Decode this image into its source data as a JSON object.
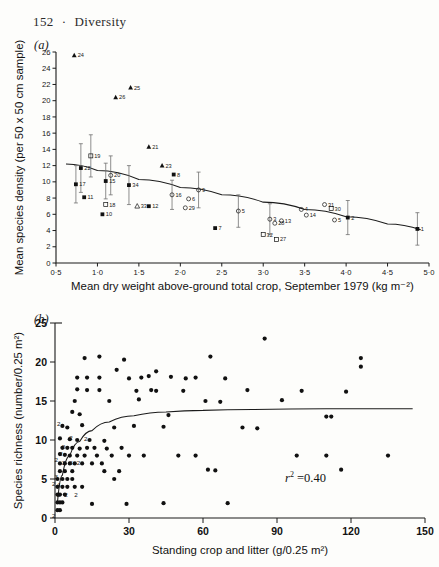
{
  "page": {
    "number": "152",
    "separator": "·",
    "running_head": "Diversity"
  },
  "panels": {
    "a_label": "(a)",
    "b_label": "(b)"
  },
  "chart_data": [
    {
      "type": "scatter",
      "panel": "(a)",
      "title": "",
      "xlabel": "Mean dry weight above-ground total crop, September 1979 (kg m⁻²)",
      "ylabel": "Mean species density (per 50 x 50 cm sample)",
      "xlim": [
        0.5,
        5.0
      ],
      "ylim": [
        0,
        26
      ],
      "xticks": [
        "0·5",
        "1·0",
        "1·5",
        "2·0",
        "2·5",
        "3·0",
        "3·5",
        "4·0",
        "4·5",
        "5·0"
      ],
      "xtick_values": [
        0.5,
        1.0,
        1.5,
        2.0,
        2.5,
        3.0,
        3.5,
        4.0,
        4.5,
        5.0
      ],
      "yticks": [
        "0",
        "2",
        "4",
        "6",
        "8",
        "10",
        "12",
        "14",
        "16",
        "18",
        "20",
        "22",
        "24",
        "26"
      ],
      "ytick_values": [
        0,
        2,
        4,
        6,
        8,
        10,
        12,
        14,
        16,
        18,
        20,
        22,
        24,
        26
      ],
      "grid": false,
      "legend": "none",
      "fit_curve": {
        "description": "declining fitted curve",
        "points": [
          [
            0.62,
            12.2
          ],
          [
            1.0,
            11.4
          ],
          [
            1.5,
            10.3
          ],
          [
            2.0,
            9.3
          ],
          [
            2.5,
            8.4
          ],
          [
            3.0,
            7.5
          ],
          [
            3.5,
            6.6
          ],
          [
            4.0,
            5.7
          ],
          [
            4.5,
            4.8
          ],
          [
            4.9,
            4.1
          ]
        ]
      },
      "points": [
        {
          "label": "24",
          "x": 0.72,
          "y": 25.6,
          "marker": "filled-triangle",
          "err": 0
        },
        {
          "label": "25",
          "x": 1.4,
          "y": 21.6,
          "marker": "filled-triangle",
          "err": 0
        },
        {
          "label": "26",
          "x": 1.22,
          "y": 20.4,
          "marker": "filled-triangle",
          "err": 0
        },
        {
          "label": "21",
          "x": 1.62,
          "y": 14.3,
          "marker": "filled-triangle",
          "err": 0
        },
        {
          "label": "19",
          "x": 0.92,
          "y": 13.2,
          "marker": "open-square",
          "err": 2.6
        },
        {
          "label": "22",
          "x": 0.8,
          "y": 11.7,
          "marker": "filled-square",
          "err": 3.0
        },
        {
          "label": "23",
          "x": 1.78,
          "y": 12.0,
          "marker": "filled-triangle",
          "err": 0
        },
        {
          "label": "8",
          "x": 1.92,
          "y": 10.9,
          "marker": "filled-square",
          "err": 0
        },
        {
          "label": "20",
          "x": 1.16,
          "y": 10.8,
          "marker": "open-circle",
          "err": 2.4
        },
        {
          "label": "15",
          "x": 1.1,
          "y": 10.1,
          "marker": "filled-square",
          "err": 2.2
        },
        {
          "label": "17",
          "x": 0.74,
          "y": 9.7,
          "marker": "filled-square",
          "err": 2.3
        },
        {
          "label": "34",
          "x": 1.38,
          "y": 9.6,
          "marker": "filled-square",
          "err": 2.4
        },
        {
          "label": "11",
          "x": 0.84,
          "y": 8.1,
          "marker": "filled-square",
          "err": 0
        },
        {
          "label": "18",
          "x": 1.1,
          "y": 7.2,
          "marker": "open-square",
          "err": 0
        },
        {
          "label": "16",
          "x": 1.9,
          "y": 8.4,
          "marker": "open-circle",
          "err": 1.8
        },
        {
          "label": "33",
          "x": 1.48,
          "y": 7.0,
          "marker": "open-triangle",
          "err": 0
        },
        {
          "label": "12",
          "x": 1.62,
          "y": 7.0,
          "marker": "filled-square",
          "err": 0
        },
        {
          "label": "10",
          "x": 1.06,
          "y": 6.0,
          "marker": "filled-square",
          "err": 0
        },
        {
          "label": "9",
          "x": 2.22,
          "y": 9.0,
          "marker": "open-circle",
          "err": 2.2
        },
        {
          "label": "6",
          "x": 2.1,
          "y": 7.9,
          "marker": "open-circle",
          "err": 0
        },
        {
          "label": "29",
          "x": 2.06,
          "y": 6.8,
          "marker": "open-circle",
          "err": 0
        },
        {
          "label": "7",
          "x": 2.42,
          "y": 4.3,
          "marker": "filled-square",
          "err": 0
        },
        {
          "label": "5",
          "x": 2.7,
          "y": 6.4,
          "marker": "open-circle",
          "err": 2.0
        },
        {
          "label": "3",
          "x": 3.08,
          "y": 5.4,
          "marker": "open-circle",
          "err": 1.9
        },
        {
          "label": "13",
          "x": 3.22,
          "y": 5.2,
          "marker": "open-circle",
          "err": 0
        },
        {
          "label": "28",
          "x": 3.14,
          "y": 4.9,
          "marker": "open-circle",
          "err": 0
        },
        {
          "label": "32",
          "x": 3.0,
          "y": 3.5,
          "marker": "open-square",
          "err": 0
        },
        {
          "label": "27",
          "x": 3.16,
          "y": 2.9,
          "marker": "open-square",
          "err": 0
        },
        {
          "label": "4",
          "x": 3.46,
          "y": 6.6,
          "marker": "open-circle",
          "err": 0
        },
        {
          "label": "31",
          "x": 3.74,
          "y": 7.2,
          "marker": "open-circle",
          "err": 0
        },
        {
          "label": "30",
          "x": 3.82,
          "y": 6.7,
          "marker": "open-square",
          "err": 0
        },
        {
          "label": "14",
          "x": 3.52,
          "y": 5.9,
          "marker": "open-circle",
          "err": 0
        },
        {
          "label": "5",
          "x": 3.86,
          "y": 5.3,
          "marker": "open-circle",
          "err": 0
        },
        {
          "label": "2",
          "x": 4.02,
          "y": 5.6,
          "marker": "filled-square",
          "err": 2.1
        },
        {
          "label": "1",
          "x": 4.86,
          "y": 4.2,
          "marker": "filled-square",
          "err": 2.0
        }
      ]
    },
    {
      "type": "scatter",
      "panel": "(b)",
      "title": "",
      "xlabel": "Standing crop and litter (g/0.25 m²)",
      "ylabel": "Species richness (number/0.25 m²)",
      "xlim": [
        0,
        150
      ],
      "ylim": [
        0,
        25
      ],
      "xticks": [
        "0",
        "30",
        "60",
        "90",
        "120",
        "150"
      ],
      "xtick_values": [
        0,
        30,
        60,
        90,
        120,
        150
      ],
      "yticks": [
        "0",
        "5",
        "10",
        "15",
        "20",
        "25"
      ],
      "ytick_values": [
        0,
        5,
        10,
        15,
        20,
        25
      ],
      "grid": false,
      "legend": "none",
      "annotation": {
        "text": "r² = 0.40",
        "symbol": "r",
        "exponent": "2",
        "value": "0.40"
      },
      "fit_curve": {
        "description": "asymptotic rising curve levelling near 14",
        "points": [
          [
            1,
            2.0
          ],
          [
            3,
            5.5
          ],
          [
            6,
            8.0
          ],
          [
            10,
            9.8
          ],
          [
            15,
            11.2
          ],
          [
            22,
            12.3
          ],
          [
            32,
            13.1
          ],
          [
            45,
            13.6
          ],
          [
            60,
            13.8
          ],
          [
            80,
            13.9
          ],
          [
            110,
            14.0
          ],
          [
            145,
            14.0
          ]
        ]
      },
      "points": [
        [
          85,
          23.0
        ],
        [
          12,
          20.5
        ],
        [
          18,
          20.7
        ],
        [
          28,
          20.3
        ],
        [
          63,
          20.7
        ],
        [
          124,
          20.5
        ],
        [
          124,
          19.4
        ],
        [
          25,
          19.0
        ],
        [
          41,
          18.8
        ],
        [
          9,
          18.0
        ],
        [
          13,
          18.0
        ],
        [
          18,
          18.0
        ],
        [
          30,
          17.9
        ],
        [
          35,
          18.0
        ],
        [
          38,
          18.2
        ],
        [
          47,
          18.1
        ],
        [
          53,
          17.9
        ],
        [
          57,
          18.0
        ],
        [
          69,
          17.9
        ],
        [
          9,
          16.5
        ],
        [
          13,
          16.4
        ],
        [
          18,
          16.4
        ],
        [
          33,
          16.3
        ],
        [
          39,
          16.4
        ],
        [
          41,
          16.3
        ],
        [
          52,
          16.3
        ],
        [
          78,
          16.4
        ],
        [
          100,
          16.3
        ],
        [
          118,
          16.2
        ],
        [
          8,
          15.0
        ],
        [
          22,
          15.0
        ],
        [
          34,
          15.2
        ],
        [
          61,
          15.0
        ],
        [
          67,
          14.9
        ],
        [
          92,
          15.1
        ],
        [
          7,
          13.6
        ],
        [
          10,
          13.3
        ],
        [
          46,
          13.2
        ],
        [
          110,
          13.0
        ],
        [
          112,
          13.0
        ],
        [
          3,
          11.8
        ],
        [
          5,
          11.6
        ],
        [
          11,
          11.9
        ],
        [
          24,
          11.6
        ],
        [
          32,
          11.8
        ],
        [
          44,
          11.7
        ],
        [
          76,
          11.6
        ],
        [
          82,
          11.5
        ],
        [
          2,
          10.2
        ],
        [
          6,
          10.1
        ],
        [
          9,
          10.0
        ],
        [
          14,
          10.0
        ],
        [
          20,
          9.9
        ],
        [
          3,
          9.0
        ],
        [
          5,
          9.0
        ],
        [
          7,
          9.0
        ],
        [
          10,
          8.9
        ],
        [
          13,
          9.0
        ],
        [
          16,
          9.0
        ],
        [
          21,
          8.9
        ],
        [
          27,
          9.0
        ],
        [
          2,
          8.2
        ],
        [
          4,
          8.1
        ],
        [
          6,
          8.0
        ],
        [
          9,
          8.0
        ],
        [
          12,
          8.0
        ],
        [
          17,
          8.0
        ],
        [
          23,
          8.0
        ],
        [
          30,
          8.0
        ],
        [
          36,
          8.0
        ],
        [
          50,
          8.0
        ],
        [
          57,
          8.0
        ],
        [
          98,
          8.0
        ],
        [
          110,
          8.0
        ],
        [
          135,
          8.0
        ],
        [
          2,
          7.0
        ],
        [
          4,
          7.0
        ],
        [
          6,
          7.0
        ],
        [
          8,
          7.0
        ],
        [
          11,
          7.0
        ],
        [
          15,
          7.0
        ],
        [
          19,
          7.0
        ],
        [
          2,
          6.0
        ],
        [
          4,
          6.0
        ],
        [
          7,
          6.0
        ],
        [
          20,
          6.0
        ],
        [
          26,
          6.0
        ],
        [
          62,
          6.2
        ],
        [
          65,
          6.1
        ],
        [
          116,
          6.2
        ],
        [
          1,
          5.0
        ],
        [
          3,
          5.0
        ],
        [
          5,
          5.0
        ],
        [
          7,
          5.0
        ],
        [
          24,
          5.0
        ],
        [
          1,
          4.0
        ],
        [
          3,
          4.0
        ],
        [
          5,
          4.0
        ],
        [
          8,
          4.0
        ],
        [
          11,
          4.0
        ],
        [
          1,
          3.0
        ],
        [
          2,
          3.0
        ],
        [
          4,
          3.0
        ],
        [
          1,
          2.0
        ],
        [
          2,
          2.0
        ],
        [
          3,
          2.0
        ],
        [
          15,
          1.8
        ],
        [
          29,
          1.8
        ],
        [
          44,
          1.9
        ],
        [
          70,
          1.9
        ],
        [
          1,
          1.0
        ],
        [
          2,
          1.0
        ]
      ],
      "multiplicity_labels": [
        {
          "text": "2",
          "x": 3,
          "y": 12.0
        },
        {
          "text": "2",
          "x": 8,
          "y": 10.2
        },
        {
          "text": "2",
          "x": 14,
          "y": 10.1
        },
        {
          "text": "2",
          "x": 5,
          "y": 9.1
        },
        {
          "text": "2",
          "x": 4,
          "y": 8.2
        },
        {
          "text": "2",
          "x": 2,
          "y": 7.4
        },
        {
          "text": "3",
          "x": 5,
          "y": 7.0
        },
        {
          "text": "3",
          "x": 8,
          "y": 7.0
        },
        {
          "text": "2",
          "x": 11,
          "y": 7.0
        },
        {
          "text": "3",
          "x": 2,
          "y": 5.2
        },
        {
          "text": "2",
          "x": 1,
          "y": 4.3
        },
        {
          "text": "4",
          "x": 3,
          "y": 4.2
        },
        {
          "text": "2",
          "x": 3,
          "y": 3.0
        },
        {
          "text": "2",
          "x": 6,
          "y": 3.0
        },
        {
          "text": "2",
          "x": 10,
          "y": 3.0
        },
        {
          "text": "2",
          "x": 1,
          "y": 0.3
        }
      ]
    }
  ]
}
